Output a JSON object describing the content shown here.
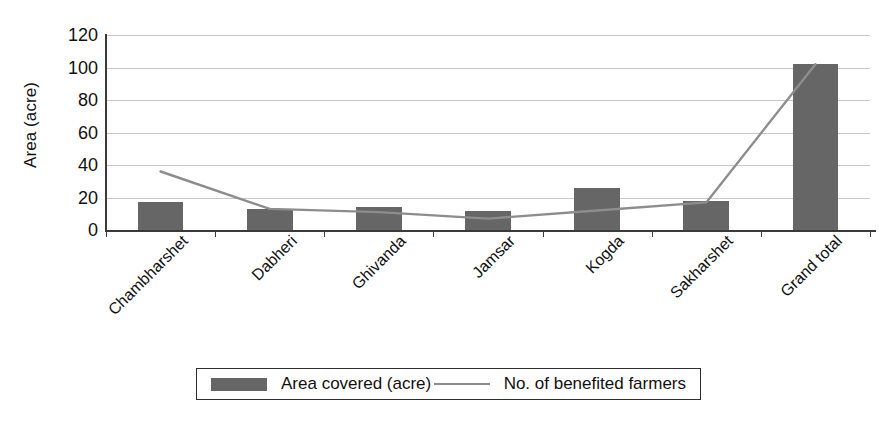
{
  "chart_data": {
    "type": "bar",
    "title": "",
    "subtitle": "",
    "xlabel": "",
    "ylabel": "Area (acre)",
    "ylim": [
      0,
      120
    ],
    "ytick_step": 20,
    "yticks": [
      0,
      20,
      40,
      60,
      80,
      100,
      120
    ],
    "ytick_labels": [
      "0",
      "20",
      "40",
      "60",
      "80",
      "100",
      "120"
    ],
    "grid": true,
    "grid_axis": "y",
    "legend_position": "bottom",
    "categories": [
      "Chambharshet",
      "Dabheri",
      "Ghivanda",
      "Jamsar",
      "Kogda",
      "Sakharshet",
      "Grand total"
    ],
    "series": [
      {
        "name": "Area covered (acre)",
        "type": "bar",
        "color": "#666666",
        "values": [
          17,
          13,
          14,
          12,
          26,
          18,
          102
        ]
      },
      {
        "name": "No. of benefited farmers",
        "type": "line",
        "color": "#8d8d8d",
        "values": [
          36,
          13,
          11,
          7,
          12,
          17,
          102
        ]
      }
    ]
  },
  "axis": {
    "y_title": "Area (acre)"
  },
  "legend": {
    "items": [
      {
        "label": "Area covered (acre)",
        "marker": "swatch"
      },
      {
        "label": "No. of benefited farmers",
        "marker": "line"
      }
    ]
  }
}
